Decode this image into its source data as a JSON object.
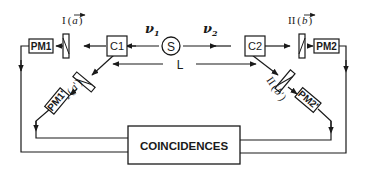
{
  "diagram": {
    "source": {
      "label": "S"
    },
    "beams": {
      "left": "ν1",
      "left_sub": "1",
      "right": "ν2",
      "right_sub": "2",
      "left_symbol": "ν",
      "right_symbol": "ν"
    },
    "distance": {
      "label": "L"
    },
    "switches": [
      {
        "label": "C1"
      },
      {
        "label": "C2"
      }
    ],
    "polarizers": [
      {
        "label": "I",
        "vector": "a",
        "side": "left",
        "path": "straight"
      },
      {
        "label": "I",
        "vector": "a'",
        "vector_base": "a",
        "side": "left",
        "path": "deflected"
      },
      {
        "label": "II",
        "vector": "b",
        "side": "right",
        "path": "straight"
      },
      {
        "label": "II",
        "vector": "b'",
        "vector_base": "b",
        "side": "right",
        "path": "deflected"
      }
    ],
    "detectors": [
      {
        "label": "PM1"
      },
      {
        "label": "PM1'"
      },
      {
        "label": "PM2"
      },
      {
        "label": "PM2'"
      }
    ],
    "coincidence": {
      "label": "COINCIDENCES"
    },
    "paren_open": "(",
    "paren_close": ")",
    "prime": "'"
  }
}
